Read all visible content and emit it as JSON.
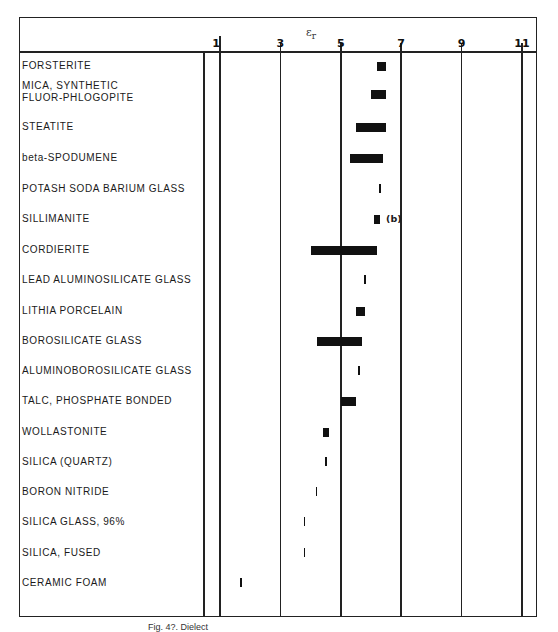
{
  "chart_data": {
    "type": "bar",
    "orientation": "horizontal-range",
    "title": "",
    "xlabel": "εr",
    "ylabel": "",
    "xlim": [
      1,
      11
    ],
    "x_ticks": [
      1,
      3,
      5,
      7,
      9,
      11
    ],
    "grid": true,
    "categories": [
      "FORSTERITE",
      "MICA, SYNTHETIC FLUOR-PHLOGOPITE",
      "STEATITE",
      "beta-SPODUMENE",
      "POTASH SODA BARIUM GLASS",
      "SILLIMANITE",
      "CORDIERITE",
      "LEAD ALUMINOSILICATE GLASS",
      "LITHIA PORCELAIN",
      "BOROSILICATE GLASS",
      "ALUMINOBOROSILICATE GLASS",
      "TALC, PHOSPHATE BONDED",
      "WOLLASTONITE",
      "SILICA (QUARTZ)",
      "BORON NITRIDE",
      "SILICA GLASS, 96%",
      "SILICA, FUSED",
      "CERAMIC FOAM"
    ],
    "series": [
      {
        "name": "dielectric constant range",
        "ranges": [
          [
            6.2,
            6.5
          ],
          [
            6.0,
            6.5
          ],
          [
            5.5,
            6.5
          ],
          [
            5.3,
            6.4
          ],
          [
            6.3,
            6.3
          ],
          [
            6.1,
            6.3
          ],
          [
            4.0,
            6.2
          ],
          [
            5.8,
            5.8
          ],
          [
            5.5,
            5.8
          ],
          [
            4.2,
            5.7
          ],
          [
            5.6,
            5.6
          ],
          [
            5.0,
            5.5
          ],
          [
            4.4,
            4.6
          ],
          [
            4.5,
            4.5
          ],
          [
            4.2,
            4.2
          ],
          [
            3.8,
            3.8
          ],
          [
            3.8,
            3.8
          ],
          [
            1.7,
            1.7
          ]
        ]
      }
    ],
    "annotations": [
      {
        "category": "SILLIMANITE",
        "text": "(b)"
      }
    ]
  },
  "axis": {
    "title": "ε",
    "title_sub": "r",
    "ticks": [
      "1",
      "3",
      "5",
      "7",
      "9",
      "11"
    ]
  },
  "rows": [
    {
      "label": "FORSTERITE",
      "lo": 6.2,
      "hi": 6.5
    },
    {
      "label": "MICA, SYNTHETIC\nFLUOR-PHLOGOPITE",
      "lo": 6.0,
      "hi": 6.5
    },
    {
      "label": "STEATITE",
      "lo": 5.5,
      "hi": 6.5
    },
    {
      "label": "beta-SPODUMENE",
      "lo": 5.3,
      "hi": 6.4
    },
    {
      "label": "POTASH SODA BARIUM GLASS",
      "lo": 6.3,
      "hi": 6.3
    },
    {
      "label": "SILLIMANITE",
      "lo": 6.1,
      "hi": 6.3,
      "note": "(b)"
    },
    {
      "label": "CORDIERITE",
      "lo": 4.0,
      "hi": 6.2
    },
    {
      "label": "LEAD ALUMINOSILICATE GLASS",
      "lo": 5.8,
      "hi": 5.8
    },
    {
      "label": "LITHIA PORCELAIN",
      "lo": 5.5,
      "hi": 5.8
    },
    {
      "label": "BOROSILICATE GLASS",
      "lo": 4.2,
      "hi": 5.7
    },
    {
      "label": "ALUMINOBOROSILICATE GLASS",
      "lo": 5.6,
      "hi": 5.6
    },
    {
      "label": "TALC, PHOSPHATE BONDED",
      "lo": 5.0,
      "hi": 5.5
    },
    {
      "label": "WOLLASTONITE",
      "lo": 4.4,
      "hi": 4.6
    },
    {
      "label": "SILICA (QUARTZ)",
      "lo": 4.5,
      "hi": 4.5
    },
    {
      "label": "BORON NITRIDE",
      "lo": 4.2,
      "hi": 4.2
    },
    {
      "label": "SILICA GLASS, 96%",
      "lo": 3.8,
      "hi": 3.8
    },
    {
      "label": "SILICA, FUSED",
      "lo": 3.8,
      "hi": 3.8
    },
    {
      "label": "CERAMIC FOAM",
      "lo": 1.7,
      "hi": 1.7
    }
  ],
  "caption": "Fig. 4?. Dielect"
}
